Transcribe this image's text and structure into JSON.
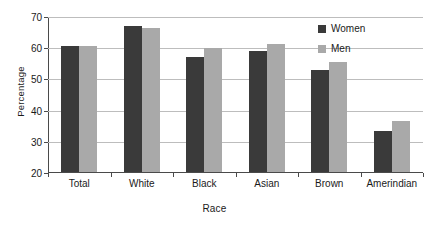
{
  "chart_data": {
    "type": "bar",
    "title": "",
    "xlabel": "Race",
    "ylabel": "Percentage",
    "categories": [
      "Total",
      "White",
      "Black",
      "Asian",
      "Brown",
      "Amerindian"
    ],
    "series": [
      {
        "name": "Women",
        "color": "#3a3a3a",
        "values": [
          60.5,
          66.9,
          57.0,
          58.7,
          52.8,
          33.0
        ]
      },
      {
        "name": "Men",
        "color": "#a9a9a9",
        "values": [
          60.5,
          66.3,
          59.7,
          61.0,
          55.3,
          36.3
        ]
      }
    ],
    "ylim": [
      20,
      70
    ],
    "yticks": [
      20,
      30,
      40,
      50,
      60,
      70
    ],
    "ytick_labels": [
      "20",
      "30",
      "40",
      "50",
      "60",
      "70"
    ],
    "grid": true,
    "legend_position": "top-right",
    "legend": [
      "Women",
      "Men"
    ]
  }
}
